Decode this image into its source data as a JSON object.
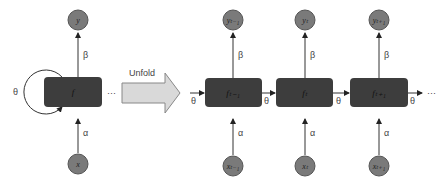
{
  "diagram": {
    "folded": {
      "output": "y",
      "cell": "f",
      "input": "x",
      "recurrent_weight": "θ",
      "input_weight": "α",
      "output_weight": "β",
      "ellipsis": "···"
    },
    "unfold_label": "Unfold",
    "unrolled": [
      {
        "output": "yₜ₋₁",
        "cell": "fₜ₋₁",
        "input": "xₜ₋₁"
      },
      {
        "output": "yₜ",
        "cell": "fₜ",
        "input": "xₜ"
      },
      {
        "output": "yₜ₊₁",
        "cell": "fₜ₊₁",
        "input": "xₜ₊₁"
      }
    ],
    "weights": {
      "theta": "θ",
      "alpha": "α",
      "beta": "β"
    },
    "trailing_ellipsis": "···",
    "colors": {
      "cell_fill": "#3d3d3d",
      "node_fill": "#7a7a7a",
      "arrow_fill": "#d9d9d9",
      "line": "#333333"
    }
  }
}
